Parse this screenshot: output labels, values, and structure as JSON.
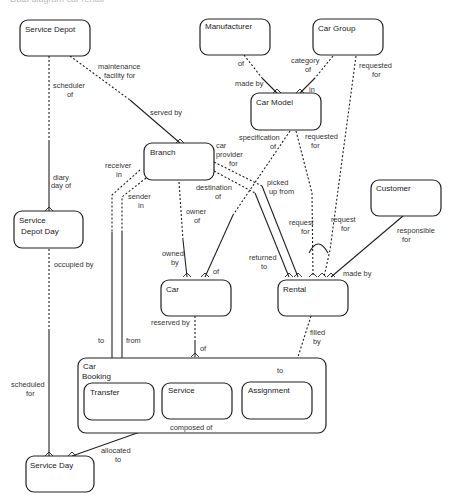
{
  "caption": "Data diagram car rental",
  "entities": {
    "service_depot": "Service Depot",
    "manufacturer": "Manufacturer",
    "car_group": "Car Group",
    "car_model": "Car Model",
    "branch": "Branch",
    "customer": "Customer",
    "service_depot_day_1": "Service",
    "service_depot_day_2": "Depot Day",
    "car": "Car",
    "rental": "Rental",
    "car_booking_1": "Car",
    "car_booking_2": "Booking",
    "transfer": "Transfer",
    "service": "Service",
    "assignment": "Assignment",
    "service_day": "Service Day"
  },
  "relationships": {
    "maintenance_facility_for_1": "maintenance",
    "maintenance_facility_for_2": "facility  for",
    "served_by": "served by",
    "scheduler_of_1": "scheduler",
    "scheduler_of_2": "of",
    "diary_day_of_1": "diary",
    "diary_day_of_2": "day of",
    "of_manufacturer": "of",
    "made_by_model": "made by",
    "category_of_1": "category",
    "category_of_2": "of",
    "in": "in",
    "requested_for_group_1": "requested",
    "requested_for_group_2": "for",
    "specification_of_1": "specification",
    "specification_of_2": "of",
    "requested_for_model_1": "requested",
    "requested_for_model_2": "for",
    "car_provider_for_1": "car",
    "car_provider_for_2": "provider",
    "car_provider_for_3": "for",
    "receiver_in_1": "receiver",
    "receiver_in_2": "in",
    "sender_in_1": "sender",
    "sender_in_2": "in",
    "destination_of_1": "destination",
    "destination_of_2": "of",
    "picked_up_from_1": "picked",
    "picked_up_from_2": "up from",
    "owner_of_1": "owner",
    "owner_of_2": "of",
    "owned_by_1": "owned",
    "owned_by_2": "by",
    "of_car": "of",
    "returned_to_1": "returned",
    "returned_to_2": "to",
    "request_for_a_1": "request",
    "request_for_a_2": "for",
    "request_for_b_1": "request",
    "request_for_b_2": "for",
    "responsible_for_1": "responsible",
    "responsible_for_2": "for",
    "made_by_rental": "made by",
    "occupied_by": "occupied by",
    "reserved_by": "reserved by",
    "of_booking": "of",
    "filled_by_1": "filled",
    "filled_by_2": "by",
    "to_transfer": "to",
    "from_transfer": "from",
    "to_assignment": "to",
    "scheduled_for_1": "scheduled",
    "scheduled_for_2": "for",
    "composed_of": "composed  of",
    "allocated_to_1": "allocated",
    "allocated_to_2": "to"
  }
}
